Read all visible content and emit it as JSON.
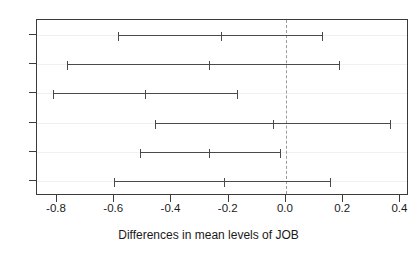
{
  "chart_data": {
    "type": "scatter",
    "title": "",
    "xlabel": "Differences in mean levels of JOB",
    "ylabel": "總任 - 科任 科任 - 組長 科任 - 主任",
    "xlim": [
      -0.87,
      0.43
    ],
    "xticks": [
      -0.8,
      -0.6,
      -0.4,
      -0.2,
      0.0,
      0.2,
      0.4
    ],
    "xticklabels": [
      "-0.8",
      "-0.6",
      "-0.4",
      "-0.2",
      "0.0",
      "0.2",
      "0.4"
    ],
    "grid": false,
    "legend": null,
    "reference_line": 0.0,
    "reference_line_style": "dashed",
    "orientation": "horizontal",
    "series_name": "95% family-wise confidence level",
    "categories": [
      "comparison-1",
      "comparison-2",
      "comparison-3",
      "comparison-4",
      "comparison-5",
      "comparison-6"
    ],
    "points": [
      {
        "label": "comparison-1",
        "lower": -0.586,
        "estimate": -0.226,
        "upper": 0.131
      },
      {
        "label": "comparison-2",
        "lower": -0.764,
        "estimate": -0.269,
        "upper": 0.189
      },
      {
        "label": "comparison-3",
        "lower": -0.815,
        "estimate": -0.491,
        "upper": -0.167
      },
      {
        "label": "comparison-4",
        "lower": -0.458,
        "estimate": -0.044,
        "upper": 0.367
      },
      {
        "label": "comparison-5",
        "lower": -0.509,
        "estimate": -0.269,
        "upper": -0.018
      },
      {
        "label": "comparison-6",
        "lower": -0.6,
        "estimate": -0.215,
        "upper": 0.156
      }
    ],
    "colors": {
      "interval": "#4a4a4a",
      "axis": "#3b3b3b",
      "reference": "#9a9a9a",
      "background": "#ffffff",
      "text": "#1a1a1a"
    }
  }
}
